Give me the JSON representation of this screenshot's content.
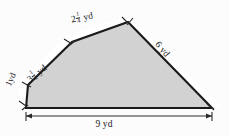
{
  "figure": {
    "unit": "yd",
    "fill_color": "#d2d2d2",
    "outline_color": "#1a1a1a",
    "background_color": "#fcfcfc",
    "sides": [
      {
        "id": "left-small",
        "label": "1 yd",
        "whole": "1",
        "fraction": null,
        "unit": "yd",
        "value": 1
      },
      {
        "id": "upper-left",
        "label": "3 1/2 yd",
        "whole": "3",
        "fraction": {
          "num": "1",
          "den": "2"
        },
        "unit": "yd",
        "value": 3.5
      },
      {
        "id": "top",
        "label": "2 1/4 yd",
        "whole": "2",
        "fraction": {
          "num": "1",
          "den": "4"
        },
        "unit": "yd",
        "value": 2.25
      },
      {
        "id": "right",
        "label": "6 yd",
        "whole": "6",
        "fraction": null,
        "unit": "yd",
        "value": 6
      },
      {
        "id": "bottom",
        "label": "9 yd",
        "whole": "9",
        "fraction": null,
        "unit": "yd",
        "value": 9
      }
    ]
  }
}
